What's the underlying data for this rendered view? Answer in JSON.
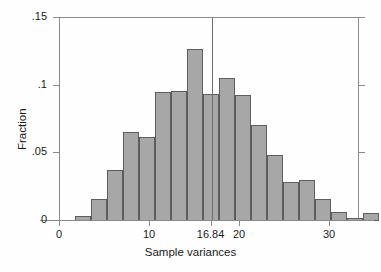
{
  "chart_data": {
    "type": "bar",
    "title": "",
    "subtitle": "",
    "xlabel": "Sample variances",
    "ylabel": "Fraction",
    "xlim": [
      0,
      33.8
    ],
    "ylim": [
      0,
      0.15
    ],
    "grid": false,
    "legend": null,
    "bin_width": 1.778,
    "xticks": [
      {
        "value": 0,
        "label": "0"
      },
      {
        "value": 10,
        "label": "10"
      },
      {
        "value": 16.84,
        "label": "16.84"
      },
      {
        "value": 20,
        "label": "20"
      },
      {
        "value": 30,
        "label": "30"
      }
    ],
    "yticks": [
      {
        "value": 0,
        "label": "0"
      },
      {
        "value": 0.05,
        "label": ".05"
      },
      {
        "value": 0.1,
        "label": ".1"
      },
      {
        "value": 0.15,
        "label": ".15"
      }
    ],
    "annotations": [
      {
        "name": "reference-line",
        "type": "vline",
        "x": 16.84,
        "y_top": 0.15,
        "y_bottom": 0.0
      }
    ],
    "bars": [
      {
        "x_left": 1.67,
        "x_center": 2.56,
        "value": 0.004
      },
      {
        "x_left": 3.44,
        "x_center": 4.33,
        "value": 0.016
      },
      {
        "x_left": 5.22,
        "x_center": 6.11,
        "value": 0.038
      },
      {
        "x_left": 7.0,
        "x_center": 7.89,
        "value": 0.066
      },
      {
        "x_left": 8.78,
        "x_center": 9.67,
        "value": 0.062
      },
      {
        "x_left": 10.56,
        "x_center": 11.44,
        "value": 0.095
      },
      {
        "x_left": 12.33,
        "x_center": 13.22,
        "value": 0.096
      },
      {
        "x_left": 14.11,
        "x_center": 15.0,
        "value": 0.127
      },
      {
        "x_left": 15.89,
        "x_center": 16.78,
        "value": 0.094
      },
      {
        "x_left": 17.67,
        "x_center": 18.56,
        "value": 0.106
      },
      {
        "x_left": 19.44,
        "x_center": 20.33,
        "value": 0.093
      },
      {
        "x_left": 21.22,
        "x_center": 22.11,
        "value": 0.071
      },
      {
        "x_left": 23.0,
        "x_center": 23.89,
        "value": 0.049
      },
      {
        "x_left": 24.78,
        "x_center": 25.67,
        "value": 0.029
      },
      {
        "x_left": 26.56,
        "x_center": 27.44,
        "value": 0.03
      },
      {
        "x_left": 28.33,
        "x_center": 29.22,
        "value": 0.016
      },
      {
        "x_left": 30.11,
        "x_center": 31.0,
        "value": 0.007
      },
      {
        "x_left": 31.89,
        "x_center": 32.78,
        "value": 0.002
      },
      {
        "x_left": 33.67,
        "x_center": 34.56,
        "value": 0.006
      }
    ],
    "colors": {
      "bar_fill": "#a7a7a7",
      "bar_edge": "#5d5d5d",
      "axis": "#8a8a8a",
      "text": "#1a1a1a",
      "background": "#fefefe",
      "reference_line": "#6e6e6e"
    }
  }
}
